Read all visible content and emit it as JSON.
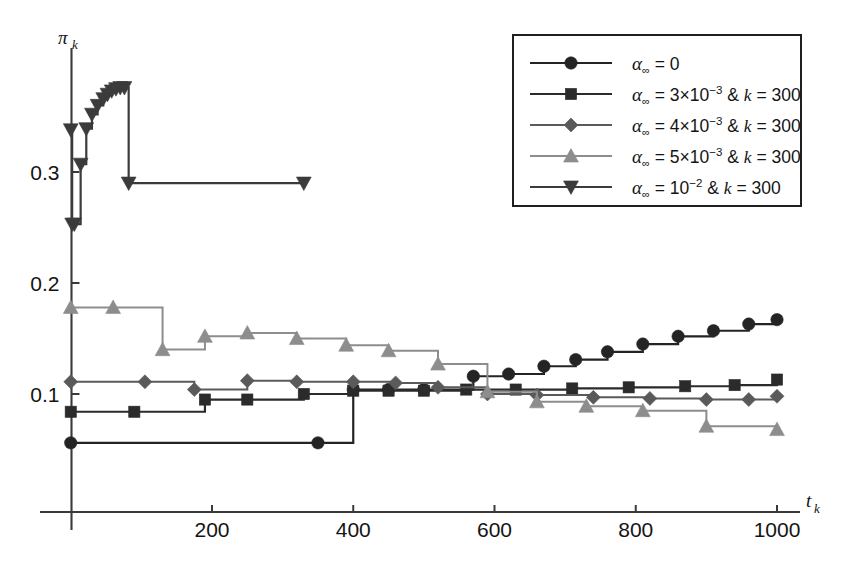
{
  "chart_data": {
    "type": "line",
    "title": "",
    "subtitle": "",
    "xlabel": "t_k",
    "ylabel": "pi_k",
    "xlabel_display": "t",
    "xlabel_sub": "k",
    "ylabel_display": "π",
    "ylabel_sub": "k",
    "xlim": [
      0,
      1030
    ],
    "ylim": [
      0.0,
      0.4
    ],
    "grid": false,
    "legend_position": "top-right",
    "xticks": [
      200,
      400,
      600,
      800,
      1000
    ],
    "xtick_labels": [
      "200",
      "400",
      "600",
      "800",
      "1000"
    ],
    "yticks": [
      0.1,
      0.2,
      0.3
    ],
    "ytick_labels": [
      "0.1",
      "0.2",
      "0.3"
    ],
    "step_style": "post",
    "series": [
      {
        "name": "alpha_inf = 0",
        "legend_label_parts": {
          "alpha": "α",
          "sub": "∞",
          "rest": " = 0"
        },
        "marker": "circle",
        "color": "#242424",
        "linewidth": 2.2,
        "x": [
          0,
          350,
          400,
          450,
          500,
          570,
          620,
          670,
          715,
          760,
          810,
          860,
          910,
          960,
          1000
        ],
        "y": [
          0.056,
          0.056,
          0.104,
          0.104,
          0.104,
          0.116,
          0.118,
          0.125,
          0.131,
          0.138,
          0.145,
          0.152,
          0.157,
          0.163,
          0.167
        ]
      },
      {
        "name": "alpha_inf = 3x10^-3 & k = 300",
        "legend_label_parts": {
          "alpha": "α",
          "sub": "∞",
          "rest": " = 3×10",
          "exp": "−3",
          "tail": " & ",
          "kvar": "k",
          "ktail": " = 300"
        },
        "marker": "square",
        "color": "#2b2b2b",
        "linewidth": 2.2,
        "x": [
          0,
          90,
          190,
          250,
          330,
          400,
          450,
          500,
          560,
          630,
          710,
          790,
          870,
          940,
          1000
        ],
        "y": [
          0.084,
          0.084,
          0.095,
          0.095,
          0.1,
          0.103,
          0.103,
          0.103,
          0.104,
          0.104,
          0.105,
          0.106,
          0.107,
          0.108,
          0.113
        ]
      },
      {
        "name": "alpha_inf = 4x10^-3 & k = 300",
        "legend_label_parts": {
          "alpha": "α",
          "sub": "∞",
          "rest": " = 4×10",
          "exp": "−3",
          "tail": " & ",
          "kvar": "k",
          "ktail": " = 300"
        },
        "marker": "diamond",
        "color": "#5a5a5a",
        "linewidth": 2.0,
        "x": [
          0,
          105,
          175,
          250,
          320,
          400,
          460,
          520,
          590,
          660,
          740,
          820,
          900,
          960,
          1000
        ],
        "y": [
          0.111,
          0.111,
          0.104,
          0.112,
          0.111,
          0.111,
          0.11,
          0.106,
          0.1,
          0.099,
          0.097,
          0.096,
          0.095,
          0.095,
          0.098
        ]
      },
      {
        "name": "alpha_inf = 5x10^-3 & k = 300",
        "legend_label_parts": {
          "alpha": "α",
          "sub": "∞",
          "rest": " = 5×10",
          "exp": "−3",
          "tail": " & ",
          "kvar": "k",
          "ktail": " = 300"
        },
        "marker": "triangle-up",
        "color": "#8d8d8d",
        "linewidth": 2.0,
        "x": [
          0,
          60,
          130,
          190,
          250,
          320,
          390,
          450,
          520,
          590,
          660,
          730,
          810,
          900,
          1000
        ],
        "y": [
          0.178,
          0.178,
          0.14,
          0.152,
          0.155,
          0.15,
          0.144,
          0.139,
          0.127,
          0.102,
          0.093,
          0.089,
          0.085,
          0.071,
          0.068
        ]
      },
      {
        "name": "alpha_inf = 10^-2 & k = 300",
        "legend_label_parts": {
          "alpha": "α",
          "sub": "∞",
          "rest": " = 10",
          "exp": "−2",
          "tail": " & ",
          "kvar": "k",
          "ktail": " = 300"
        },
        "marker": "triangle-down",
        "color": "#3b3b3b",
        "linewidth": 2.2,
        "x": [
          0,
          2,
          5,
          14,
          22,
          30,
          38,
          46,
          52,
          58,
          64,
          70,
          76,
          82,
          330
        ],
        "y": [
          0.338,
          0.253,
          0.253,
          0.307,
          0.339,
          0.352,
          0.36,
          0.366,
          0.37,
          0.373,
          0.375,
          0.376,
          0.376,
          0.29,
          0.29
        ]
      }
    ]
  },
  "legend": {
    "entries": [
      {
        "label": "α∞ = 0",
        "marker": "circle"
      },
      {
        "label": "α∞ = 3×10⁻³ & k = 300",
        "marker": "square"
      },
      {
        "label": "α∞ = 4×10⁻³ & k = 300",
        "marker": "diamond"
      },
      {
        "label": "α∞ = 5×10⁻³ & k = 300",
        "marker": "triangle-up"
      },
      {
        "label": "α∞ = 10⁻² & k = 300",
        "marker": "triangle-down"
      }
    ]
  },
  "colors": {
    "background": "#ffffff",
    "axis": "#3a3a3a",
    "text": "#141414",
    "series_black": "#242424",
    "series_dark": "#2b2b2b",
    "series_mid": "#5a5a5a",
    "series_light": "#8d8d8d",
    "legend_border": "#1f1f1f"
  }
}
